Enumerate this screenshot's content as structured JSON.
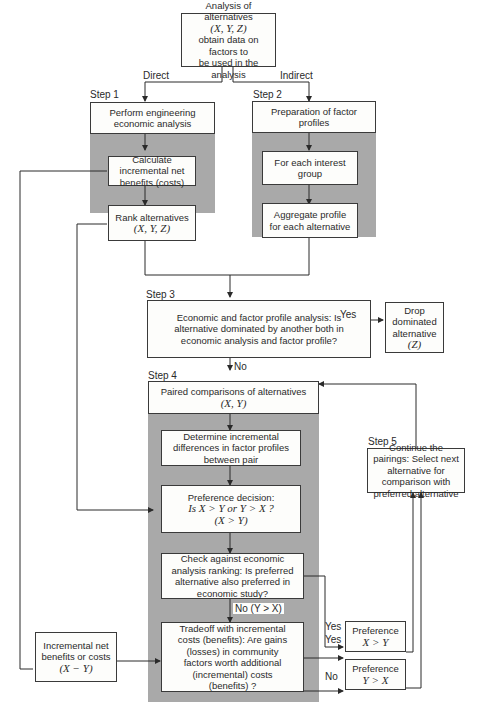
{
  "start": {
    "line1": "Analysis of alternatives",
    "line2": "(X, Y, Z)",
    "line3": "obtain data on factors to",
    "line4": "be used in the analysis"
  },
  "branch_labels": {
    "direct": "Direct",
    "indirect": "Indirect"
  },
  "step1": {
    "label": "Step 1",
    "box1": "Perform engineering economic analysis",
    "box2": "Calculate incremental net benefits (costs)",
    "box3_line1": "Rank alternatives",
    "box3_line2": "(X, Y, Z)"
  },
  "step2": {
    "label": "Step 2",
    "box1": "Preparation of factor profiles",
    "box2": "For each interest group",
    "box3": "Aggregate profile for each alternative"
  },
  "step3": {
    "label": "Step 3",
    "box": "Economic and factor profile analysis: Is alternative dominated by another both in economic analysis and factor profile?",
    "yes_label": "Yes",
    "no_label": "No",
    "drop_line1": "Drop dominated alternative",
    "drop_line2": "(Z)"
  },
  "step4": {
    "label": "Step 4",
    "box1_line1": "Paired comparisons of alternatives",
    "box1_line2": "(X, Y)",
    "box2": "Determine incremental differences in factor profiles between pair",
    "box3_line1": "Preference decision:",
    "box3_line2": "Is X > Y or Y > X ?",
    "box3_line3": "(X > Y)",
    "box4": "Check against economic analysis ranking:  Is preferred alternative also preferred in economic study?",
    "no_label": "No (Y > X)",
    "box5": "Tradeoff with incremental costs (benefits):  Are gains (losses) in community factors worth additional (incremental) costs (benefits) ?"
  },
  "step5": {
    "label": "Step 5",
    "box": "Continue the pairings: Select next alternative for comparison with preferred alternative"
  },
  "outcomes": {
    "yes1": "Yes",
    "yes2": "Yes",
    "no": "No",
    "pref_xy_line1": "Preference",
    "pref_xy_line2": "X > Y",
    "pref_yx_line1": "Preference",
    "pref_yx_line2": "Y > X"
  },
  "incremental": {
    "line1": "Incremental net benefits or costs",
    "line2": "(X − Y)"
  }
}
